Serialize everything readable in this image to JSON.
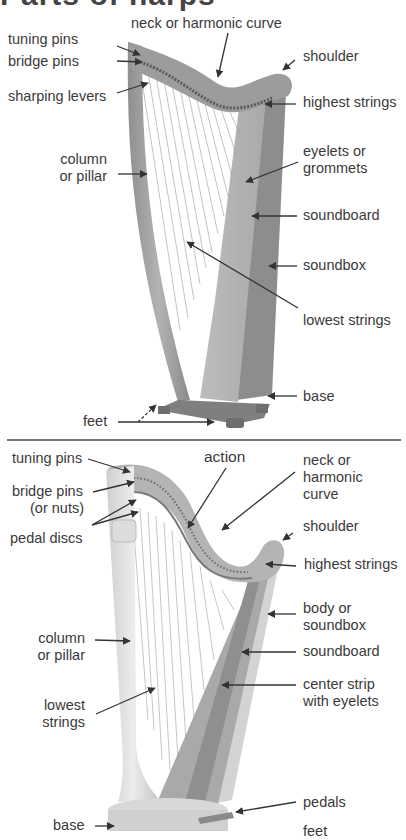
{
  "title": "Parts of harps",
  "lever_harp": {
    "labels": {
      "neck": "neck or harmonic curve",
      "tuning_pins": "tuning pins",
      "bridge_pins": "bridge pins",
      "sharping_levers": "sharping levers",
      "shoulder": "shoulder",
      "highest_strings": "highest strings",
      "column_l1": "column",
      "column_l2": "or pillar",
      "eyelets_l1": "eyelets or",
      "eyelets_l2": "grommets",
      "soundboard": "soundboard",
      "soundbox": "soundbox",
      "lowest_strings": "lowest strings",
      "base": "base",
      "feet": "feet"
    }
  },
  "pedal_harp": {
    "labels": {
      "tuning_pins": "tuning pins",
      "action": "action",
      "neck_l1": "neck or",
      "neck_l2": "harmonic",
      "neck_l3": "curve",
      "bridge_pins_l1": "bridge pins",
      "bridge_pins_l2": "(or nuts)",
      "pedal_discs": "pedal discs",
      "shoulder": "shoulder",
      "highest_strings": "highest strings",
      "body_l1": "body or",
      "body_l2": "soundbox",
      "column_l1": "column",
      "column_l2": "or pillar",
      "soundboard": "soundboard",
      "center_l1": "center strip",
      "center_l2": "with eyelets",
      "lowest_l1": "lowest",
      "lowest_l2": "strings",
      "pedals": "pedals",
      "base": "base",
      "feet": "feet"
    }
  }
}
